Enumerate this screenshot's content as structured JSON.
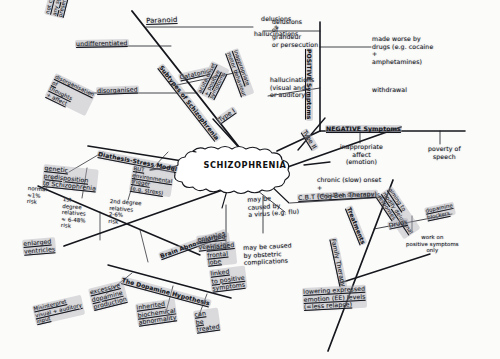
{
  "diagram": {
    "title": "SCHIZOPHRENIA",
    "type": "hand-drawn mind map",
    "center_label": "SCHIZOPHRENIA",
    "branches": {
      "subtypes": {
        "spine_label": "Subtypes of Schizophrenia",
        "items": [
          {
            "label": "Paranoid",
            "detail": "delusions\n+\nhallucinations"
          },
          {
            "label": "undifferentiated",
            "detail": "not clear if\nany symptoms\npresent"
          },
          {
            "label": "disorganised",
            "detail": "disorganisation\nof\nthoughts\n+ affect"
          },
          {
            "label": "Catatonic",
            "detail": "inappropriate\nmotor behaviour"
          }
        ]
      },
      "positive_symptoms": {
        "spine_label": "POSITIVE Symptoms",
        "items": [
          {
            "label": "delusions\nof\ngrandeur\nor persecution"
          },
          {
            "label": "hallucinations\n(visual and /\nor auditory)"
          },
          {
            "label": "made worse by\ndrugs (e.g. cocaine\n+\namphetamines)"
          },
          {
            "label": "withdrawal"
          }
        ]
      },
      "negative_symptoms": {
        "spine_label": "NEGATIVE Symptoms",
        "items": [
          {
            "label": "inappropriate\naffect\n(emotion)"
          },
          {
            "label": "poverty of\nspeech"
          }
        ]
      },
      "types": {
        "type_1": {
          "label": "Type I",
          "detail": "acute onset\n+ positive\nsymptoms"
        },
        "type_2": {
          "label": "Type II",
          "detail": "chronic (slow) onset\n+\nnegative symptoms"
        }
      },
      "diathesis_stress": {
        "spine_label": "Diathesis-Stress Model",
        "items": [
          {
            "label": "genetic\npredisposition\nto Schizophrenia"
          },
          {
            "label": "normal\n≈1%\nrisk"
          },
          {
            "label": "1st\ndegree\nrelatives\n≈ 6-48%\nrisk"
          },
          {
            "label": "2nd degree\nrelatives\n2-6%\nrisk"
          },
          {
            "label": "BUT\nenvironmental\ntrigger\n(e.g. stress)"
          }
        ]
      },
      "brain_abnormalities": {
        "spine_label": "Brain Abnormalities",
        "items": [
          {
            "label": "enlarged\nventricles"
          },
          {
            "label": "enlarged\nfrontal\nlobe"
          },
          {
            "label": "linked\nto positive\nsymptoms"
          },
          {
            "label": "may be\ncaused by\na virus (e.g. flu)"
          },
          {
            "label": "may be caused\nby obstetric\ncomplications"
          }
        ]
      },
      "dopamine_hypothesis": {
        "spine_label": "The Dopamine Hypothesis",
        "items": [
          {
            "label": "excessive\ndopamine\nproduction"
          },
          {
            "label": "Misinterpret\nvisual + auditory\ninput"
          },
          {
            "label": "inherited\nbiochemical\nabnormality"
          },
          {
            "label": "can\nbe\ntreated"
          }
        ]
      },
      "treatments": {
        "spine_label": "Treatments",
        "items": [
          {
            "label": "C.B.T (Cog-Beh Therapy)",
            "detail": "aiming to\nmodify delusional\nresponses"
          },
          {
            "label": "Drugs",
            "detail": "dopamine\nblockers",
            "detail2": "work on\npositive symptoms\nonly"
          },
          {
            "label": "Family Therapy",
            "detail": "lowering expressed\nemotion (EE) levels\n(=less relapse)"
          }
        ]
      }
    }
  }
}
